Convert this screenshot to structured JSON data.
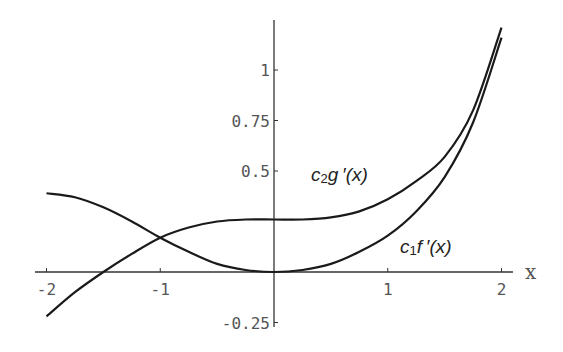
{
  "chart_data": {
    "type": "line",
    "title": "",
    "xlabel": "x",
    "ylabel": "",
    "xlim": [
      -2,
      2
    ],
    "ylim": [
      -0.25,
      1.25
    ],
    "grid": false,
    "legend": "none (inline curve labels)",
    "x_ticks": [
      "-2",
      "-1",
      "1",
      "2"
    ],
    "y_ticks": [
      "1",
      "0.75",
      "0.5",
      "-0.25"
    ],
    "x": [
      -2,
      -1.75,
      -1.5,
      -1.25,
      -1,
      -0.75,
      -0.5,
      -0.25,
      0,
      0.25,
      0.5,
      0.75,
      1,
      1.25,
      1.5,
      1.75,
      2
    ],
    "series": [
      {
        "name": "c2g'(x)",
        "label_main": "c",
        "label_sub": "2",
        "label_rest": "g ′(x)",
        "values": [
          -0.22,
          -0.1,
          0.0,
          0.09,
          0.17,
          0.22,
          0.25,
          0.26,
          0.26,
          0.26,
          0.27,
          0.3,
          0.36,
          0.45,
          0.57,
          0.8,
          1.21
        ]
      },
      {
        "name": "c1f'(x)",
        "label_main": "c",
        "label_sub": "1",
        "label_rest": "f ′(x)",
        "values": [
          0.39,
          0.37,
          0.32,
          0.25,
          0.17,
          0.1,
          0.04,
          0.01,
          0.0,
          0.01,
          0.04,
          0.1,
          0.18,
          0.3,
          0.47,
          0.74,
          1.16
        ]
      }
    ]
  }
}
